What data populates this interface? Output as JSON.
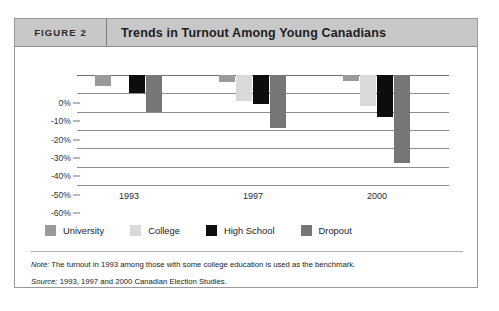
{
  "figure": {
    "number_label": "FIGURE 2",
    "title": "Trends in Turnout Among Young Canadians"
  },
  "notes": {
    "note_lead": "Note:",
    "note_text": " The turnout in 1993 among those with some college education is used as the benchmark.",
    "source_lead": "Source:",
    "source_text": " 1993, 1997 and 2000 Canadian Election Studies."
  },
  "chart_data": {
    "type": "bar",
    "title": "Trends in Turnout Among Young Canadians",
    "xlabel": "",
    "ylabel": "",
    "categories": [
      "1993",
      "1997",
      "2000"
    ],
    "ylim": [
      -60,
      0
    ],
    "ytick_labels": [
      "0%",
      "-10%",
      "-20%",
      "-30%",
      "-40%",
      "-50%",
      "-60%"
    ],
    "ytick_values": [
      0,
      -10,
      -20,
      -30,
      -40,
      -50,
      -60
    ],
    "grid": true,
    "legend_position": "bottom-left",
    "value_suffix": "%",
    "series": [
      {
        "name": "University",
        "color": "#9a9a9a",
        "values": [
          -6,
          -4,
          -3
        ]
      },
      {
        "name": "College",
        "color": "#d9d9d9",
        "values": [
          0,
          -14,
          -17
        ]
      },
      {
        "name": "High School",
        "color": "#0d0d0d",
        "values": [
          -10,
          -16,
          -23
        ]
      },
      {
        "name": "Dropout",
        "color": "#767676",
        "values": [
          -20,
          -29,
          -48
        ]
      }
    ]
  }
}
